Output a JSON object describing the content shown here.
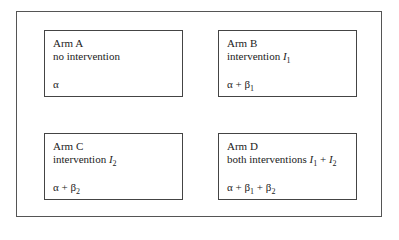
{
  "diagram": {
    "type": "2x2 factorial trial design",
    "arms": [
      {
        "id": "A",
        "name": "Arm A",
        "description": "no intervention",
        "effect": "α"
      },
      {
        "id": "B",
        "name": "Arm B",
        "description_prefix": "intervention ",
        "description_symbol": "I",
        "description_sub": "1",
        "effect_parts": [
          "α",
          "+",
          "β",
          "1"
        ]
      },
      {
        "id": "C",
        "name": "Arm C",
        "description_prefix": "intervention ",
        "description_symbol": "I",
        "description_sub": "2",
        "effect_parts": [
          "α",
          "+",
          "β",
          "2"
        ]
      },
      {
        "id": "D",
        "name": "Arm D",
        "description_prefix": "both interventions ",
        "description_symbol_1": "I",
        "description_sub_1": "1",
        "description_op": "+",
        "description_symbol_2": "I",
        "description_sub_2": "2",
        "effect_parts": [
          "α",
          "+",
          "β",
          "1",
          "+",
          "β",
          "2"
        ]
      }
    ]
  }
}
